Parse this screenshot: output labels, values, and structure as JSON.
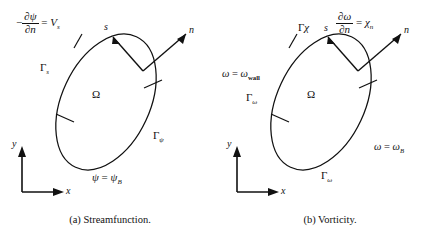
{
  "figure": {
    "background": "#ffffff",
    "ink": "#111111"
  },
  "panels": [
    {
      "id": "a",
      "caption": "(a) Streamfunction.",
      "domain_label": "Ω",
      "axes": {
        "x": "x",
        "y": "y"
      },
      "vectors": [
        {
          "name": "tangent",
          "label": "s"
        },
        {
          "name": "normal",
          "label": "n"
        }
      ],
      "boundary_segments": [
        {
          "name": "gamma-s",
          "gamma": "Γ",
          "gamma_sub": "s"
        },
        {
          "name": "gamma-psi",
          "gamma": "Γ",
          "gamma_sub": "ψ"
        }
      ],
      "conditions": [
        {
          "name": "neumann-streamfunction",
          "lhs_sign": "−",
          "numerator": "∂ψ",
          "denominator": "∂n",
          "equals": "=",
          "rhs": "V",
          "rhs_sub": "s"
        },
        {
          "name": "dirichlet-streamfunction",
          "lhs": "ψ",
          "equals": "=",
          "rhs": "ψ",
          "rhs_sub": "B"
        }
      ]
    },
    {
      "id": "b",
      "caption": "(b) Vorticity.",
      "domain_label": "Ω",
      "axes": {
        "x": "x",
        "y": "y"
      },
      "vectors": [
        {
          "name": "tangent",
          "label": "s"
        },
        {
          "name": "normal",
          "label": "n"
        }
      ],
      "boundary_segments": [
        {
          "name": "gamma-chi",
          "gamma": "Γ",
          "gamma_sub": "χ"
        },
        {
          "name": "gamma-omega-left",
          "gamma": "Γ",
          "gamma_sub": "ω"
        },
        {
          "name": "gamma-omega-bottom",
          "gamma": "Γ",
          "gamma_sub": "ω"
        }
      ],
      "conditions": [
        {
          "name": "neumann-vorticity",
          "numerator": "∂ω",
          "denominator": "∂n",
          "equals": "=",
          "rhs": "χ",
          "rhs_sub": "n"
        },
        {
          "name": "wall-vorticity",
          "lhs": "ω",
          "equals": "=",
          "rhs": "ω",
          "rhs_sub": "wall"
        },
        {
          "name": "dirichlet-vorticity",
          "lhs": "ω",
          "equals": "=",
          "rhs": "ω",
          "rhs_sub": "B"
        }
      ]
    }
  ]
}
